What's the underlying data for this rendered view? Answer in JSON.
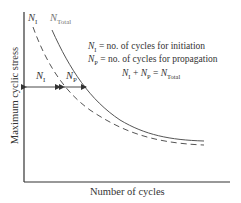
{
  "diagram": {
    "y_axis_label": "Maximum cyclic stress",
    "x_axis_label": "Number of cycles",
    "curves": [
      {
        "name": "initiation",
        "label_main": "N",
        "label_sub": "I",
        "style": "dashed",
        "color": "#555555"
      },
      {
        "name": "total",
        "label_main": "N",
        "label_sub": "Total",
        "style": "solid",
        "color": "#555555"
      }
    ],
    "arrows": [
      {
        "label_main": "N",
        "label_sub": "I"
      },
      {
        "label_main": "N",
        "label_sub": "P"
      }
    ],
    "legend": [
      {
        "main": "N",
        "sub": "I",
        "text": " = no. of cycles for initiation"
      },
      {
        "main": "N",
        "sub": "P",
        "text": " = no. of cycles for propagation"
      }
    ],
    "equation": {
      "a_main": "N",
      "a_sub": "I",
      "plus": " + ",
      "b_main": "N",
      "b_sub": "P",
      "eq": " = ",
      "c_main": "N",
      "c_sub": "Total"
    }
  }
}
